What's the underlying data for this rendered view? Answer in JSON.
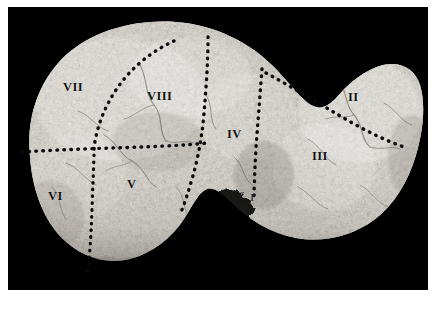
{
  "figure": {
    "kind": "anatomical-photograph",
    "view": "anterior-diaphragmatic-surface",
    "background_color": "#000000",
    "page_color": "#ffffff",
    "plate": {
      "x": 8,
      "y": 7,
      "width": 420,
      "height": 283
    }
  },
  "segment_labels": [
    {
      "id": "VII",
      "text": "VII",
      "x": 63,
      "y": 81,
      "size": "normal",
      "faint": false
    },
    {
      "id": "VIII",
      "text": "VIII",
      "x": 147,
      "y": 90,
      "size": "normal",
      "faint": false
    },
    {
      "id": "IV",
      "text": "IV",
      "x": 227,
      "y": 128,
      "size": "normal",
      "faint": false
    },
    {
      "id": "II",
      "text": "II",
      "x": 348,
      "y": 91,
      "size": "normal",
      "faint": false
    },
    {
      "id": "III",
      "text": "III",
      "x": 312,
      "y": 150,
      "size": "normal",
      "faint": false
    },
    {
      "id": "V",
      "text": "V",
      "x": 127,
      "y": 178,
      "size": "normal",
      "faint": false
    },
    {
      "id": "VI",
      "text": "VI",
      "x": 48,
      "y": 190,
      "size": "normal",
      "faint": false
    },
    {
      "id": "I",
      "text": "I",
      "x": 250,
      "y": 192,
      "size": "small",
      "faint": true
    }
  ],
  "division_lines": [
    {
      "id": "right-intersegmental-horizontal",
      "description": "horizontal dotted line across right lobe"
    },
    {
      "id": "right-portal-fissure",
      "description": "dotted line separating segment VII from VIII"
    },
    {
      "id": "main-portal-fissure",
      "description": "dotted line separating right lobe from segment IV"
    },
    {
      "id": "umbilical-fissure",
      "description": "dotted line separating segment IV from segments II and III"
    },
    {
      "id": "left-portal-fissure",
      "description": "dotted line separating segment II from segment III"
    },
    {
      "id": "segment-v-vi-boundary",
      "description": "vertical dotted line between segments VI and V"
    }
  ],
  "colors": {
    "background": "#000000",
    "page": "#ffffff",
    "specimen_light": "#f3f1ec",
    "specimen_mid": "#cfcbc2",
    "specimen_dark": "#8d8880",
    "dotted_line": "#0d0d0d",
    "label_text": "#111111"
  }
}
